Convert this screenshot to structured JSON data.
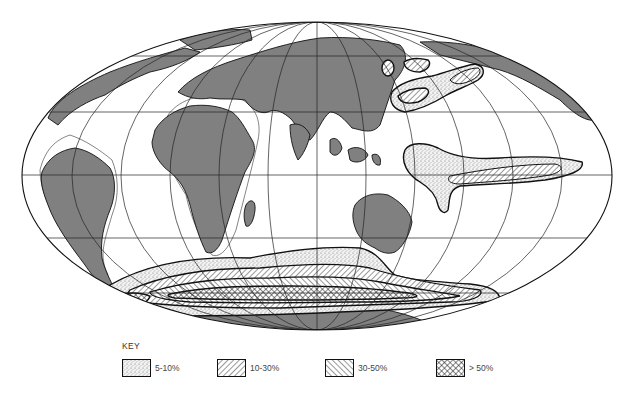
{
  "map": {
    "projection": "Mollweide (world, equal-area)",
    "land_color": "#808080",
    "ocean_color": "#ffffff",
    "line_color": "#111111",
    "regions": [
      {
        "name": "North Pacific patches",
        "classes": [
          "5-10%",
          "10-30%"
        ]
      },
      {
        "name": "Equatorial Pacific tongue",
        "classes": [
          "5-10%",
          "10-30%"
        ]
      },
      {
        "name": "Southern Ocean belt",
        "classes": [
          "5-10%",
          "10-30%",
          "30-50%",
          "> 50%"
        ]
      }
    ]
  },
  "key": {
    "title": "KEY",
    "items": [
      {
        "label": "5-10%",
        "pattern": "stipple"
      },
      {
        "label": "10-30%",
        "pattern": "hatch-forward"
      },
      {
        "label": "30-50%",
        "pattern": "hatch-backward"
      },
      {
        "label": "> 50%",
        "pattern": "crosshatch"
      }
    ]
  }
}
